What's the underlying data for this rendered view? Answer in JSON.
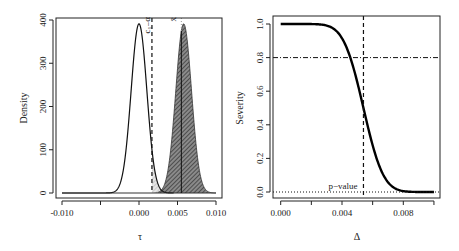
{
  "chart_data": [
    {
      "type": "area",
      "panel": "left",
      "xlabel": "τ",
      "ylabel": "Density",
      "xlim": [
        -0.0105,
        0.0105
      ],
      "ylim": [
        0,
        400
      ],
      "x_ticks": [
        -0.01,
        -0.005,
        0.0,
        0.005,
        0.01
      ],
      "x_tick_labels": [
        "-0.010",
        "",
        "0.000",
        "0.005",
        "0.010"
      ],
      "y_ticks": [
        0,
        100,
        200,
        300,
        400
      ],
      "y_tick_labels": [
        "0",
        "100",
        "200",
        "300",
        "400"
      ],
      "series": [
        {
          "name": "null density",
          "distribution": "normal",
          "mean": 0.0,
          "sd": 0.00102,
          "line": "solid",
          "shade_right_of": 0.00168,
          "shade": "light hatch"
        },
        {
          "name": "alternative density",
          "distribution": "normal",
          "mean": 0.0058,
          "sd": 0.00102,
          "line": "solid",
          "shade_right_of": 0.00168,
          "shade": "dark hatch"
        }
      ],
      "vlines": [
        {
          "name": "critical value",
          "x": 0.00168,
          "style": "dashed",
          "label": "c₁₋α"
        },
        {
          "name": "observed mean",
          "x": 0.0055,
          "style": "solid/dotted",
          "label": "x̄"
        }
      ],
      "grid": false
    },
    {
      "type": "line",
      "panel": "right",
      "xlabel": "Δ",
      "ylabel": "Severity",
      "xlim": [
        -0.0004,
        0.0104
      ],
      "ylim": [
        -0.02,
        1.05
      ],
      "x_ticks": [
        0.0,
        0.002,
        0.004,
        0.006,
        0.008,
        0.01
      ],
      "x_tick_labels": [
        "0.000",
        "",
        "0.004",
        "",
        "0.008",
        ""
      ],
      "y_ticks": [
        0.0,
        0.2,
        0.4,
        0.6,
        0.8,
        1.0
      ],
      "y_tick_labels": [
        "0.0",
        "0.2",
        "0.4",
        "0.6",
        "0.8",
        "1.0"
      ],
      "series": [
        {
          "name": "severity curve",
          "formula": "Phi((xbar - Δ)/sd)",
          "xbar": 0.0054,
          "sd": 0.00102,
          "x_range": [
            0.0,
            0.01
          ],
          "line": "thick solid"
        }
      ],
      "hlines": [
        {
          "name": "severity 0.8",
          "y": 0.8,
          "style": "dashdot"
        },
        {
          "name": "p-value level",
          "y": 0.0,
          "style": "dotted",
          "label": "p−value"
        }
      ],
      "vlines": [
        {
          "name": "observed difference",
          "x": 0.0054,
          "style": "dashed"
        }
      ],
      "grid": false
    }
  ]
}
